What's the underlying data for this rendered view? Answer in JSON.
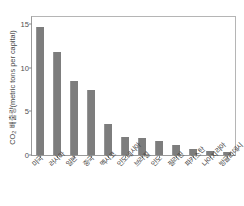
{
  "chart_data": {
    "type": "bar",
    "title": "",
    "xlabel": "",
    "ylabel": "CO₂ 배출량(metric tons per capital)",
    "ylabel_prefix": "CO",
    "ylabel_sub": "2",
    "ylabel_rest": " 배출량(metric tons per capital)",
    "categories": [
      "미국",
      "러시아",
      "일본",
      "중국",
      "멕시코",
      "인도네시아",
      "브라질",
      "인도",
      "필리핀",
      "파키스탄",
      "나이지리아",
      "방글라데시"
    ],
    "values": [
      14.6,
      11.8,
      8.5,
      7.4,
      3.6,
      2.1,
      1.9,
      1.6,
      1.1,
      0.7,
      0.5,
      0.3
    ],
    "ylim": [
      0,
      15.8
    ],
    "yticks": [
      0,
      5,
      10,
      15
    ],
    "ytick_labels": [
      "0",
      "5",
      "10",
      "15"
    ],
    "grid": false,
    "legend": false,
    "bar_color": "#7d7d7d",
    "axis_color": "#9a9a9a"
  },
  "figure": {
    "title_text": ""
  }
}
